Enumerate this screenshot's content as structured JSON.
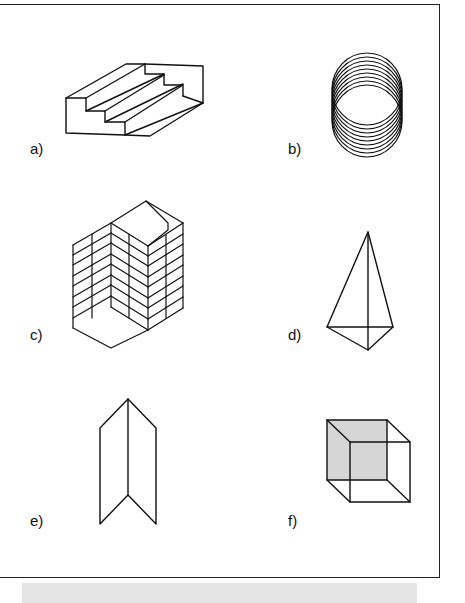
{
  "figure": {
    "panels": [
      {
        "id": "a",
        "label": "a)",
        "subject": "ambiguous staircase"
      },
      {
        "id": "b",
        "label": "b)",
        "subject": "stacked overlapping rings"
      },
      {
        "id": "c",
        "label": "c)",
        "subject": "ambiguous block building"
      },
      {
        "id": "d",
        "label": "d)",
        "subject": "wire-frame pyramid"
      },
      {
        "id": "e",
        "label": "e)",
        "subject": "folded card (Mach figure)"
      },
      {
        "id": "f",
        "label": "f)",
        "subject": "Necker cube"
      }
    ],
    "colors": {
      "line": "#111111",
      "shade": "#d6d6d6",
      "caption_bg": "#e4e4e4"
    },
    "caption": ""
  }
}
